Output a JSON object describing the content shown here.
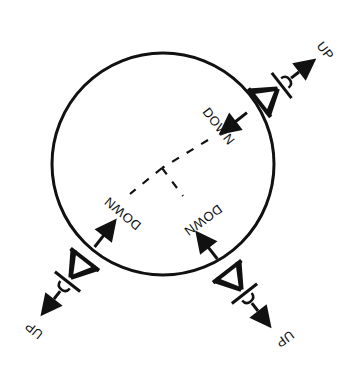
{
  "diagram": {
    "type": "landing-gear-directions",
    "colors": {
      "ink": "#111111",
      "background": "#ffffff"
    },
    "circle": {
      "cx": 163,
      "cy": 164,
      "r": 111
    },
    "mechanisms": [
      {
        "id": "upper-right",
        "inward_label": "DOWN",
        "outward_label": "UP"
      },
      {
        "id": "lower-left",
        "inward_label": "DOWN",
        "outward_label": "UP"
      },
      {
        "id": "lower-right",
        "inward_label": "DOWN",
        "outward_label": "UP"
      }
    ],
    "labels": {
      "down_upper_right": "DOWN",
      "down_lower_left": "DOWN",
      "down_lower_right": "DOWN",
      "up_upper_right": "UP",
      "up_lower_left": "UP",
      "up_lower_right": "UP"
    }
  }
}
